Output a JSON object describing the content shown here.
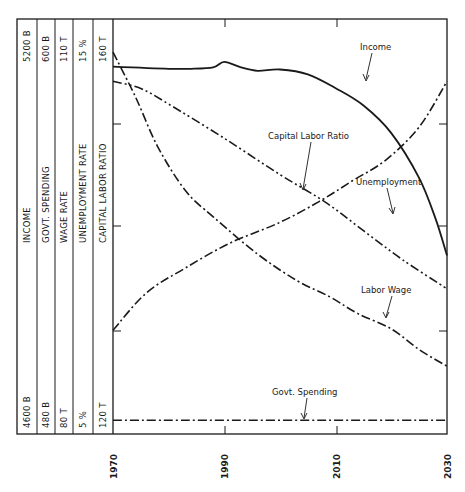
{
  "chart_data": {
    "type": "line",
    "title": "",
    "xlabel": "",
    "ylabel": "",
    "x_ticks": [
      "1970",
      "1990",
      "2010",
      "2030"
    ],
    "xlim": [
      1970,
      2030
    ],
    "grid": false,
    "legend_position": "inline annotations with arrows",
    "scales": [
      {
        "name": "INCOME",
        "min_label": "4600 B",
        "max_label": "5200 B",
        "min": 4600,
        "max": 5200
      },
      {
        "name": "GOVT. SPENDING",
        "min_label": "480 B",
        "max_label": "600 B",
        "min": 480,
        "max": 600
      },
      {
        "name": "WAGE RATE",
        "min_label": "80 T",
        "max_label": "110 T",
        "min": 80,
        "max": 110
      },
      {
        "name": "UNEMPLOYMENT RATE",
        "min_label": "5 %",
        "max_label": "15 %",
        "min": 5,
        "max": 15
      },
      {
        "name": "CAPITAL LABOR RATIO",
        "min_label": "120 T",
        "max_label": "160 T",
        "min": 120,
        "max": 160
      }
    ],
    "series": [
      {
        "name": "Income",
        "scale": "INCOME",
        "style": "solid",
        "x": [
          1970,
          1980,
          1984,
          1988,
          1990,
          1993,
          1996,
          2000,
          2005,
          2010,
          2015,
          2020,
          2025,
          2028,
          2030
        ],
        "values": [
          5131,
          5128,
          5128,
          5130,
          5138,
          5130,
          5125,
          5127,
          5120,
          5100,
          5075,
          5035,
          4970,
          4910,
          4858
        ]
      },
      {
        "name": "Govt. Spending",
        "scale": "GOVT. SPENDING",
        "style": "dash-dot",
        "x": [
          1970,
          2030
        ],
        "values": [
          484,
          484
        ]
      },
      {
        "name": "Labor Wage",
        "scale": "WAGE RATE",
        "style": "dash-dot",
        "x": [
          1970,
          1974,
          1978,
          1983,
          1988,
          1996,
          2003,
          2009,
          2014,
          2020,
          2025,
          2030
        ],
        "values": [
          107.6,
          104.4,
          100.8,
          97.6,
          95.7,
          93.0,
          91.1,
          89.9,
          88.7,
          87.6,
          86.1,
          84.9
        ]
      },
      {
        "name": "Unemployment",
        "scale": "UNEMPLOYMENT RATE",
        "style": "dash-dot",
        "x": [
          1970,
          1976,
          1983,
          1991,
          2000,
          2007,
          2013,
          2019,
          2025,
          2030
        ],
        "values": [
          7.5,
          8.4,
          9.0,
          9.6,
          10.1,
          10.6,
          11.1,
          11.6,
          12.4,
          13.5
        ]
      },
      {
        "name": "Capital Labor Ratio",
        "scale": "CAPITAL LABOR RATIO",
        "style": "dash-dot-dot",
        "x": [
          1970,
          1975,
          1980,
          1990,
          2000,
          2008,
          2015,
          2022,
          2030
        ],
        "values": [
          154.0,
          153.3,
          151.8,
          148.5,
          145.0,
          142.4,
          139.6,
          136.8,
          134.0
        ]
      }
    ],
    "annotations": [
      {
        "text": "Income",
        "series": "Income"
      },
      {
        "text": "Capital Labor Ratio",
        "series": "Capital Labor Ratio"
      },
      {
        "text": "Unemployment",
        "series": "Unemployment"
      },
      {
        "text": "Labor Wage",
        "series": "Labor Wage"
      },
      {
        "text": "Govt. Spending",
        "series": "Govt. Spending"
      }
    ]
  },
  "colors": {
    "ink": "#1a1a1a",
    "background": "#ffffff"
  }
}
